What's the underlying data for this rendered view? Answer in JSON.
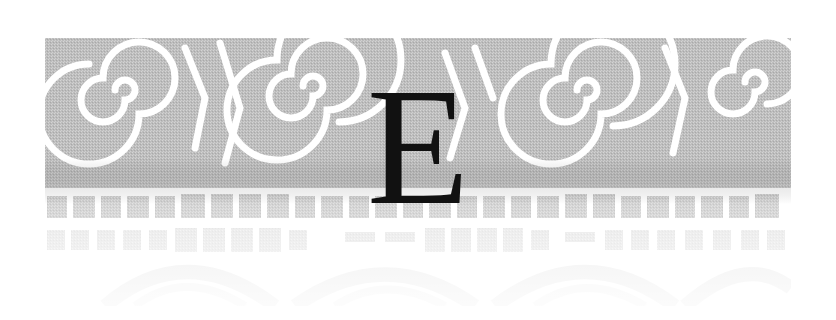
{
  "chapter_opener": {
    "letter": "E",
    "letter_color": "#111111"
  },
  "banner": {
    "pattern": "spiral-and-block ornamental band",
    "spiral_count_top": 4,
    "tone_top": "#b8b8b8",
    "tone_bottom": "#f4f4f4",
    "background": "#ffffff"
  }
}
